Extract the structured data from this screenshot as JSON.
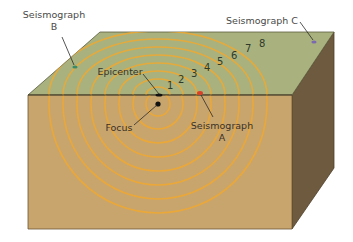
{
  "diagram": {
    "block": {
      "top_face_color": "#a9b27e",
      "front_face_color": "#c9a56e",
      "side_face_color": "#6e5a3e",
      "wave_color": "#f0a830"
    },
    "labels": {
      "seismograph_b_line1": "Seismograph",
      "seismograph_b_line2": "B",
      "seismograph_c": "Seismograph C",
      "epicenter": "Epicenter",
      "focus": "Focus",
      "seismograph_a_line1": "Seismograph",
      "seismograph_a_line2": "A"
    },
    "wave_numbers": [
      "1",
      "2",
      "3",
      "4",
      "5",
      "6",
      "7",
      "8"
    ],
    "markers": {
      "seismograph_a_color": "#d8402a",
      "seismograph_b_color": "#3a8a6a",
      "seismograph_c_color": "#7a68b0",
      "focus_color": "#111111",
      "epicenter_color": "#111111"
    }
  }
}
